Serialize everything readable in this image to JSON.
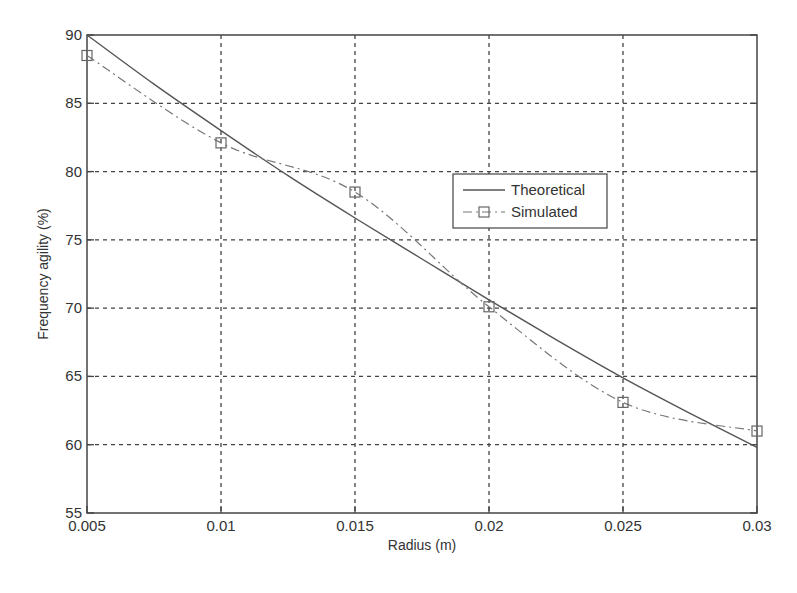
{
  "chart_data": {
    "type": "line",
    "title": "",
    "xlabel": "Radius (m)",
    "ylabel": "Frequency agility (%)",
    "xlim": [
      0.005,
      0.03
    ],
    "ylim": [
      55,
      90
    ],
    "grid": true,
    "x_ticks": [
      0.005,
      0.01,
      0.015,
      0.02,
      0.025,
      0.03
    ],
    "x_tick_labels": [
      "0.005",
      "0.01",
      "0.015",
      "0.02",
      "0.025",
      "0.03"
    ],
    "y_ticks": [
      55,
      60,
      65,
      70,
      75,
      80,
      85,
      90
    ],
    "y_tick_labels": [
      "55",
      "60",
      "65",
      "70",
      "75",
      "80",
      "85",
      "90"
    ],
    "legend_position": "center-right",
    "series": [
      {
        "name": "Theoretical",
        "style": "solid",
        "marker": "none",
        "color": "#555555",
        "x": [
          0.005,
          0.0075,
          0.01,
          0.0125,
          0.015,
          0.0175,
          0.02,
          0.0225,
          0.025,
          0.0275,
          0.03
        ],
        "values": [
          90.0,
          86.4,
          83.0,
          79.7,
          76.6,
          73.6,
          70.6,
          67.7,
          64.9,
          62.3,
          59.8
        ]
      },
      {
        "name": "Simulated",
        "style": "dashdot",
        "marker": "square",
        "color": "#777777",
        "x": [
          0.005,
          0.01,
          0.015,
          0.02,
          0.025,
          0.03
        ],
        "values": [
          88.5,
          82.1,
          78.5,
          70.1,
          63.1,
          61.0
        ]
      }
    ]
  }
}
